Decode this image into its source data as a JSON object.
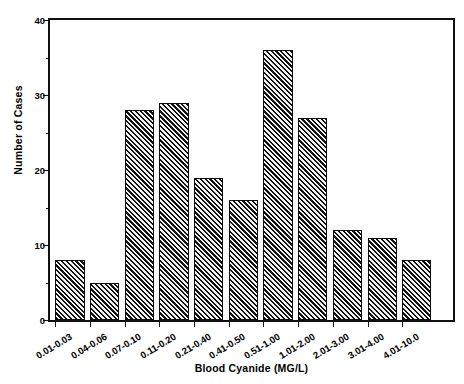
{
  "chart_data": {
    "type": "bar",
    "title": "",
    "xlabel": "Blood Cyanide (MG/L)",
    "ylabel": "Number of Cases",
    "categories": [
      "0.01-0.03",
      "0.04-0.06",
      "0.07-0.10",
      "0.11-0.20",
      "0.21-0.40",
      "0.41-0.50",
      "0.51-1.00",
      "1.01-2.00",
      "2.01-3.00",
      "3.01-4.00",
      "4.01-10.0"
    ],
    "values": [
      8,
      5,
      28,
      29,
      19,
      16,
      36,
      27,
      12,
      11,
      8
    ],
    "ylim": [
      0,
      40
    ],
    "yticks": [
      0,
      10,
      20,
      30,
      40
    ],
    "ytick_labels": [
      "0",
      "10",
      "20",
      "30",
      "40"
    ],
    "yminor_ticks": [
      5,
      15,
      25,
      35
    ],
    "grid": false,
    "legend": false,
    "bar_color": "#3f3f3f",
    "bar_edge_color": "#0b0b0b",
    "bar_fill_pattern": "diagonal-hatch",
    "axis_color": "#111111"
  }
}
